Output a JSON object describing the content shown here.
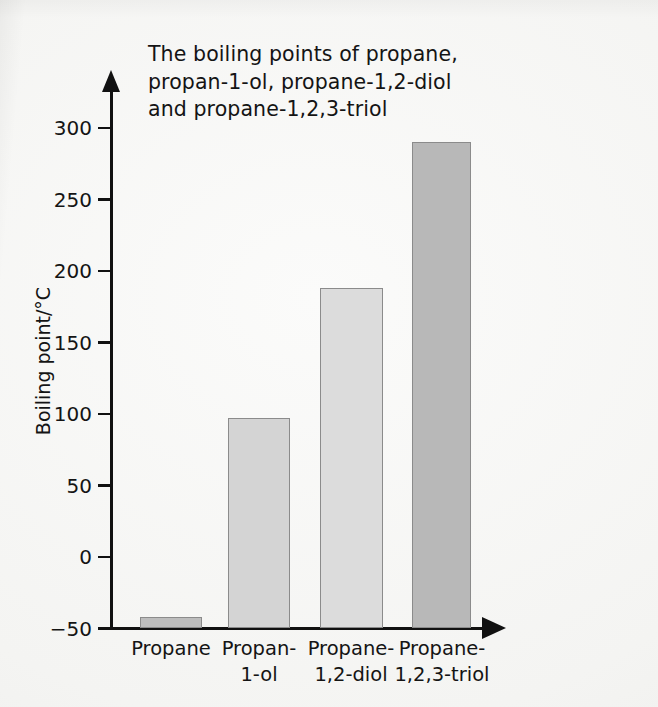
{
  "figure": {
    "title": "The boiling points of propane,\npropan-1-ol, propane-1,2-diol\nand propane-1,2,3-triol",
    "background_color": "#f4f4f2",
    "axis_color": "#111111"
  },
  "chart_data": {
    "type": "bar",
    "title": "The boiling points of propane, propan-1-ol, propane-1,2-diol and propane-1,2,3-triol",
    "xlabel": "",
    "ylabel": "Boiling point/°C",
    "categories": [
      "Propane",
      "Propan-1-ol",
      "Propane-1,2-diol",
      "Propane-1,2,3-triol"
    ],
    "category_labels_wrapped": [
      "Propane",
      "Propan-\n1-ol",
      "Propane-\n1,2-diol",
      "Propane-\n1,2,3-triol"
    ],
    "values": [
      -42,
      97,
      188,
      290
    ],
    "bar_colors": [
      "#bdbdbd",
      "#d4d4d4",
      "#dcdcdc",
      "#b8b8b8"
    ],
    "bar_edge_color": "#8b8b8b",
    "ylim": [
      -50,
      310
    ],
    "baseline": -50,
    "yticks": [
      -50,
      0,
      50,
      100,
      150,
      200,
      250,
      300
    ],
    "ytick_labels": [
      "−50",
      "0",
      "50",
      "100",
      "150",
      "200",
      "250",
      "300"
    ],
    "grid": false,
    "legend": false,
    "axis_style": "arrow-ended axes, ticks outside on y-axis only"
  }
}
